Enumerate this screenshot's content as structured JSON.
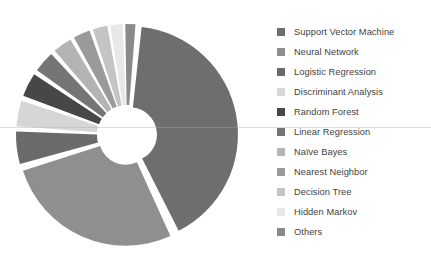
{
  "chart_data": {
    "type": "pie",
    "variant": "exploded-donut",
    "title": "",
    "xlabel": "",
    "ylabel": "",
    "grid": false,
    "legend_position": "right",
    "center": [
      127,
      135
    ],
    "outer_radius": 108,
    "inner_radius": 27,
    "start_angle_deg": 5,
    "explode_gap_px": 3,
    "categories": [
      "Support Vector Machine",
      "Neural Network",
      "Logistic Regression",
      "Discriminant Analysis",
      "Random Forest",
      "Linear Regression",
      "Naïve Bayes",
      "Nearest Neighbor",
      "Decision Tree",
      "Hidden Markov",
      "Others"
    ],
    "values": [
      41.5,
      27.5,
      5.5,
      4.5,
      4.2,
      3.8,
      3.4,
      3.0,
      2.6,
      2.2,
      1.8
    ],
    "colors": [
      "#6e6e6e",
      "#8f8f8f",
      "#6a6a6a",
      "#d6d6d6",
      "#474747",
      "#757575",
      "#b4b4b4",
      "#9a9a9a",
      "#c4c4c4",
      "#e8e8e8",
      "#8a8a8a"
    ]
  },
  "legend": {
    "items": [
      {
        "label": "Support Vector Machine",
        "color": "#6e6e6e"
      },
      {
        "label": "Neural Network",
        "color": "#8f8f8f"
      },
      {
        "label": "Logistic Regression",
        "color": "#6a6a6a"
      },
      {
        "label": "Discriminant Analysis",
        "color": "#d6d6d6"
      },
      {
        "label": "Random Forest",
        "color": "#474747"
      },
      {
        "label": "Linear Regression",
        "color": "#757575"
      },
      {
        "label": "Naïve Bayes",
        "color": "#b4b4b4"
      },
      {
        "label": "Nearest Neighbor",
        "color": "#9a9a9a"
      },
      {
        "label": "Decision Tree",
        "color": "#c4c4c4"
      },
      {
        "label": "Hidden Markov",
        "color": "#e8e8e8"
      },
      {
        "label": "Others",
        "color": "#8a8a8a"
      }
    ]
  }
}
